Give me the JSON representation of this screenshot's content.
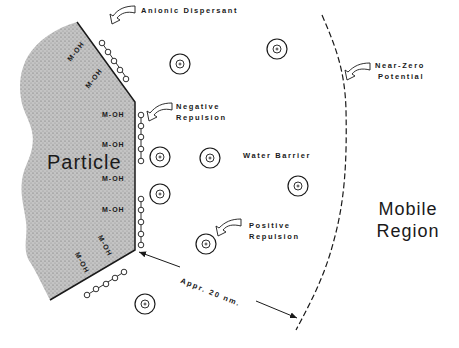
{
  "diagram": {
    "labels": {
      "anionic_dispersant": "Anionic Dispersant",
      "negative_repulsion_1": "Negative",
      "negative_repulsion_2": "Repulsion",
      "near_zero_1": "Near-Zero",
      "near_zero_2": "Potential",
      "particle": "Particle",
      "water_barrier": "Water Barrier",
      "positive_repulsion_1": "Positive",
      "positive_repulsion_2": "Repulsion",
      "mobile_1": "Mobile",
      "mobile_2": "Region",
      "distance": "Appr. 20 nm.",
      "moh": "M-OH"
    },
    "surface_groups": [
      "M-OH",
      "M-OH",
      "M-OH",
      "M-OH",
      "M-OH",
      "M-OH",
      "M-OH",
      "M-OH"
    ],
    "colors": {
      "line": "#1a1a1a",
      "particle_fill": "#b8b8b8",
      "background": "#ffffff"
    }
  }
}
